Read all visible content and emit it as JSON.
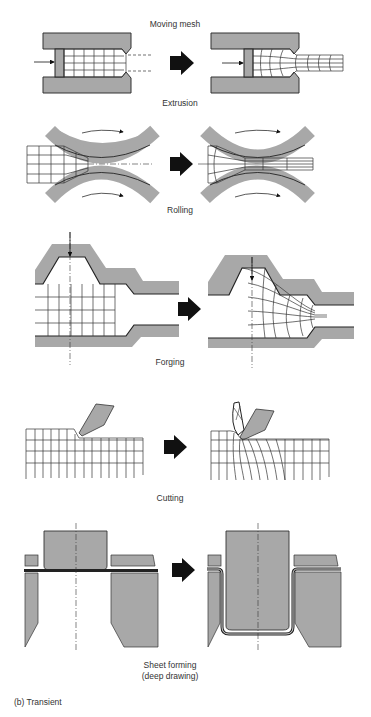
{
  "header": {
    "title": "Moving mesh"
  },
  "processes": [
    {
      "id": "extrusion",
      "label": "Extrusion"
    },
    {
      "id": "rolling",
      "label": "Rolling"
    },
    {
      "id": "forging",
      "label": "Forging"
    },
    {
      "id": "cutting",
      "label": "Cutting"
    },
    {
      "id": "sheet-forming",
      "label_line1": "Sheet forming",
      "label_line2": "(deep drawing)"
    }
  ],
  "caption": "(b) Transient",
  "colors": {
    "tool_gray": "#a8a8a8",
    "line": "#222222",
    "arrow": "#111111"
  }
}
